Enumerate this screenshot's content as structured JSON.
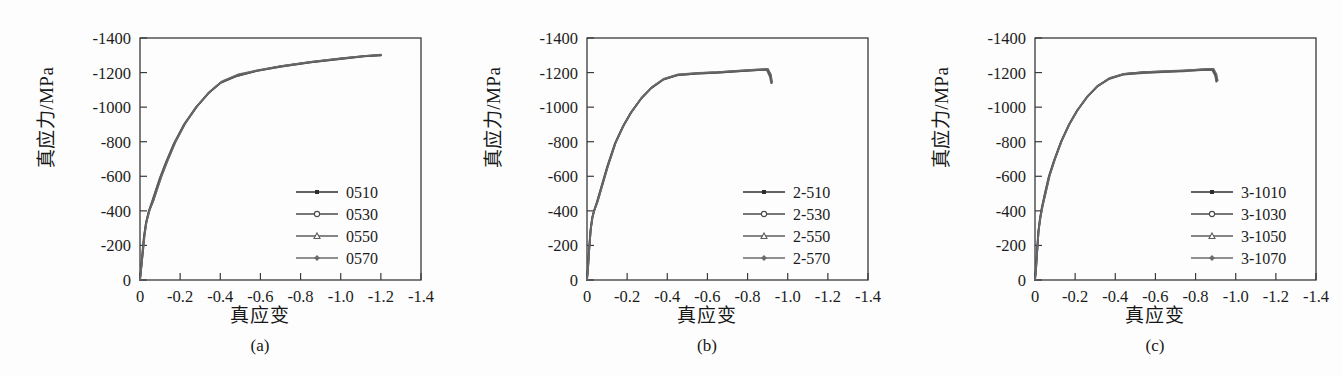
{
  "figure": {
    "background_color": "#fdfdfd",
    "axis_color": "#3a3a3a",
    "text_color": "#1c1c1c"
  },
  "chart_data": [
    {
      "type": "line",
      "panel": "a",
      "caption": "(a)",
      "title": "",
      "xlabel": "真应变",
      "ylabel": "真应力/MPa",
      "xlim": [
        0,
        -1.4
      ],
      "ylim": [
        0,
        -1400
      ],
      "xticks": [
        "0",
        "-0.2",
        "-0.4",
        "-0.6",
        "-0.8",
        "-1.0",
        "-1.2",
        "-1.4"
      ],
      "xtick_values": [
        0,
        -0.2,
        -0.4,
        -0.6,
        -0.8,
        -1.0,
        -1.2,
        -1.4
      ],
      "yticks": [
        "0",
        "-200",
        "-400",
        "-600",
        "-800",
        "-1000",
        "-1200",
        "-1400"
      ],
      "ytick_values": [
        0,
        -200,
        -400,
        -600,
        -800,
        -1000,
        -1200,
        -1400
      ],
      "grid": false,
      "legend_position": "lower-right",
      "series": [
        {
          "name": "0510",
          "color": "#2e2e2e",
          "marker": "filled-square",
          "x": [
            0,
            -0.005,
            -0.012,
            -0.02,
            -0.03,
            -0.045,
            -0.06,
            -0.08,
            -0.1,
            -0.13,
            -0.17,
            -0.22,
            -0.28,
            -0.34,
            -0.4,
            -0.48,
            -0.58,
            -0.7,
            -0.85,
            -1.0,
            -1.12,
            -1.2
          ],
          "y": [
            0,
            -60,
            -150,
            -250,
            -330,
            -400,
            -450,
            -520,
            -590,
            -680,
            -790,
            -900,
            -1000,
            -1080,
            -1140,
            -1180,
            -1210,
            -1235,
            -1260,
            -1280,
            -1295,
            -1300
          ]
        },
        {
          "name": "0530",
          "color": "#4a4a4a",
          "marker": "open-circle",
          "x": [
            0,
            -0.006,
            -0.014,
            -0.022,
            -0.032,
            -0.048,
            -0.065,
            -0.085,
            -0.105,
            -0.135,
            -0.175,
            -0.225,
            -0.285,
            -0.345,
            -0.405,
            -0.485,
            -0.585,
            -0.705,
            -0.855,
            -1.005,
            -1.125,
            -1.2
          ],
          "y": [
            0,
            -65,
            -155,
            -255,
            -335,
            -405,
            -455,
            -525,
            -595,
            -685,
            -795,
            -905,
            -1005,
            -1085,
            -1145,
            -1185,
            -1212,
            -1238,
            -1262,
            -1282,
            -1296,
            -1302
          ]
        },
        {
          "name": "0550",
          "color": "#5c5c5c",
          "marker": "open-triangle",
          "x": [
            0,
            -0.004,
            -0.011,
            -0.019,
            -0.029,
            -0.043,
            -0.058,
            -0.078,
            -0.098,
            -0.128,
            -0.168,
            -0.218,
            -0.278,
            -0.338,
            -0.398,
            -0.478,
            -0.578,
            -0.698,
            -0.848,
            -0.998,
            -1.118,
            -1.2
          ],
          "y": [
            0,
            -58,
            -148,
            -248,
            -328,
            -398,
            -448,
            -518,
            -588,
            -678,
            -788,
            -898,
            -998,
            -1078,
            -1138,
            -1178,
            -1208,
            -1232,
            -1258,
            -1278,
            -1293,
            -1299
          ]
        },
        {
          "name": "0570",
          "color": "#6b6b6b",
          "marker": "filled-diamond",
          "x": [
            0,
            -0.007,
            -0.015,
            -0.024,
            -0.034,
            -0.05,
            -0.068,
            -0.088,
            -0.108,
            -0.138,
            -0.178,
            -0.228,
            -0.288,
            -0.348,
            -0.408,
            -0.488,
            -0.588,
            -0.708,
            -0.858,
            -1.008,
            -1.128,
            -1.2
          ],
          "y": [
            0,
            -70,
            -160,
            -260,
            -340,
            -410,
            -460,
            -530,
            -600,
            -690,
            -800,
            -910,
            -1010,
            -1090,
            -1150,
            -1190,
            -1215,
            -1240,
            -1264,
            -1284,
            -1298,
            -1304
          ]
        }
      ]
    },
    {
      "type": "line",
      "panel": "b",
      "caption": "(b)",
      "title": "",
      "xlabel": "真应变",
      "ylabel": "真应力/MPa",
      "xlim": [
        0,
        -1.4
      ],
      "ylim": [
        0,
        -1400
      ],
      "xticks": [
        "0",
        "-0.2",
        "-0.4",
        "-0.6",
        "-0.8",
        "-1.0",
        "-1.2",
        "-1.4"
      ],
      "xtick_values": [
        0,
        -0.2,
        -0.4,
        -0.6,
        -0.8,
        -1.0,
        -1.2,
        -1.4
      ],
      "yticks": [
        "0",
        "-200",
        "-400",
        "-600",
        "-800",
        "-1000",
        "-1200",
        "-1400"
      ],
      "ytick_values": [
        0,
        -200,
        -400,
        -600,
        -800,
        -1000,
        -1200,
        -1400
      ],
      "grid": false,
      "legend_position": "lower-right",
      "series": [
        {
          "name": "2-510",
          "color": "#2e2e2e",
          "marker": "filled-square",
          "x": [
            0,
            -0.004,
            -0.01,
            -0.018,
            -0.026,
            -0.035,
            -0.05,
            -0.07,
            -0.1,
            -0.14,
            -0.18,
            -0.22,
            -0.27,
            -0.32,
            -0.38,
            -0.45,
            -0.55,
            -0.65,
            -0.75,
            -0.85,
            -0.9,
            -0.915,
            -0.92
          ],
          "y": [
            0,
            -60,
            -170,
            -290,
            -360,
            -400,
            -450,
            -530,
            -650,
            -790,
            -890,
            -970,
            -1050,
            -1110,
            -1160,
            -1185,
            -1195,
            -1200,
            -1208,
            -1215,
            -1218,
            -1180,
            -1140
          ]
        },
        {
          "name": "2-530",
          "color": "#4a4a4a",
          "marker": "open-circle",
          "x": [
            0,
            -0.005,
            -0.011,
            -0.019,
            -0.028,
            -0.037,
            -0.053,
            -0.073,
            -0.103,
            -0.143,
            -0.183,
            -0.223,
            -0.273,
            -0.323,
            -0.383,
            -0.453,
            -0.553,
            -0.653,
            -0.753,
            -0.853,
            -0.9,
            -0.915,
            -0.92
          ],
          "y": [
            0,
            -62,
            -175,
            -295,
            -365,
            -405,
            -455,
            -535,
            -655,
            -795,
            -895,
            -975,
            -1055,
            -1115,
            -1163,
            -1188,
            -1197,
            -1202,
            -1210,
            -1217,
            -1220,
            -1185,
            -1145
          ]
        },
        {
          "name": "2-550",
          "color": "#5c5c5c",
          "marker": "open-triangle",
          "x": [
            0,
            -0.003,
            -0.009,
            -0.017,
            -0.025,
            -0.034,
            -0.048,
            -0.068,
            -0.098,
            -0.138,
            -0.178,
            -0.218,
            -0.268,
            -0.318,
            -0.378,
            -0.448,
            -0.548,
            -0.648,
            -0.748,
            -0.848,
            -0.895,
            -0.91,
            -0.918
          ],
          "y": [
            0,
            -58,
            -168,
            -288,
            -358,
            -398,
            -448,
            -528,
            -648,
            -788,
            -888,
            -968,
            -1048,
            -1108,
            -1158,
            -1183,
            -1193,
            -1198,
            -1206,
            -1213,
            -1216,
            -1178,
            -1138
          ]
        },
        {
          "name": "2-570",
          "color": "#6b6b6b",
          "marker": "filled-diamond",
          "x": [
            0,
            -0.006,
            -0.012,
            -0.02,
            -0.029,
            -0.039,
            -0.055,
            -0.075,
            -0.105,
            -0.145,
            -0.185,
            -0.225,
            -0.275,
            -0.325,
            -0.385,
            -0.455,
            -0.555,
            -0.655,
            -0.755,
            -0.855,
            -0.902,
            -0.917,
            -0.922
          ],
          "y": [
            0,
            -65,
            -178,
            -298,
            -368,
            -408,
            -458,
            -538,
            -658,
            -798,
            -898,
            -978,
            -1058,
            -1118,
            -1166,
            -1190,
            -1199,
            -1204,
            -1212,
            -1219,
            -1222,
            -1188,
            -1148
          ]
        }
      ]
    },
    {
      "type": "line",
      "panel": "c",
      "caption": "(c)",
      "title": "",
      "xlabel": "真应变",
      "ylabel": "真应力/MPa",
      "xlim": [
        0,
        -1.4
      ],
      "ylim": [
        0,
        -1400
      ],
      "xticks": [
        "0",
        "-0.2",
        "-0.4",
        "-0.6",
        "-0.8",
        "-1.0",
        "-1.2",
        "-1.4"
      ],
      "xtick_values": [
        0,
        -0.2,
        -0.4,
        -0.6,
        -0.8,
        -1.0,
        -1.2,
        -1.4
      ],
      "yticks": [
        "0",
        "-200",
        "-400",
        "-600",
        "-800",
        "-1000",
        "-1200",
        "-1400"
      ],
      "ytick_values": [
        0,
        -200,
        -400,
        -600,
        -800,
        -1000,
        -1200,
        -1400
      ],
      "grid": false,
      "legend_position": "lower-right",
      "series": [
        {
          "name": "3-1010",
          "color": "#2e2e2e",
          "marker": "filled-square",
          "x": [
            0,
            -0.004,
            -0.01,
            -0.017,
            -0.025,
            -0.035,
            -0.05,
            -0.07,
            -0.095,
            -0.13,
            -0.17,
            -0.21,
            -0.26,
            -0.31,
            -0.37,
            -0.44,
            -0.54,
            -0.64,
            -0.74,
            -0.83,
            -0.885,
            -0.9,
            -0.905
          ],
          "y": [
            0,
            -55,
            -160,
            -280,
            -355,
            -420,
            -500,
            -600,
            -690,
            -800,
            -900,
            -980,
            -1060,
            -1120,
            -1165,
            -1190,
            -1200,
            -1205,
            -1210,
            -1216,
            -1218,
            -1185,
            -1150
          ]
        },
        {
          "name": "3-1030",
          "color": "#4a4a4a",
          "marker": "open-circle",
          "x": [
            0,
            -0.005,
            -0.011,
            -0.018,
            -0.027,
            -0.037,
            -0.053,
            -0.073,
            -0.098,
            -0.133,
            -0.173,
            -0.213,
            -0.263,
            -0.313,
            -0.373,
            -0.443,
            -0.543,
            -0.643,
            -0.743,
            -0.833,
            -0.888,
            -0.902,
            -0.908
          ],
          "y": [
            0,
            -58,
            -165,
            -285,
            -358,
            -425,
            -505,
            -605,
            -695,
            -805,
            -905,
            -985,
            -1063,
            -1123,
            -1168,
            -1192,
            -1202,
            -1207,
            -1212,
            -1218,
            -1221,
            -1188,
            -1153
          ]
        },
        {
          "name": "3-1050",
          "color": "#5c5c5c",
          "marker": "open-triangle",
          "x": [
            0,
            -0.003,
            -0.009,
            -0.016,
            -0.024,
            -0.033,
            -0.048,
            -0.068,
            -0.093,
            -0.128,
            -0.168,
            -0.208,
            -0.258,
            -0.308,
            -0.368,
            -0.438,
            -0.538,
            -0.638,
            -0.738,
            -0.828,
            -0.882,
            -0.897,
            -0.903
          ],
          "y": [
            0,
            -52,
            -157,
            -277,
            -352,
            -417,
            -497,
            -597,
            -687,
            -797,
            -897,
            -977,
            -1057,
            -1117,
            -1162,
            -1187,
            -1197,
            -1202,
            -1207,
            -1213,
            -1215,
            -1182,
            -1147
          ]
        },
        {
          "name": "3-1070",
          "color": "#6b6b6b",
          "marker": "filled-diamond",
          "x": [
            0,
            -0.006,
            -0.012,
            -0.019,
            -0.028,
            -0.039,
            -0.055,
            -0.075,
            -0.1,
            -0.135,
            -0.175,
            -0.215,
            -0.265,
            -0.315,
            -0.375,
            -0.445,
            -0.545,
            -0.645,
            -0.745,
            -0.835,
            -0.89,
            -0.905,
            -0.911
          ],
          "y": [
            0,
            -60,
            -168,
            -288,
            -362,
            -428,
            -508,
            -608,
            -698,
            -808,
            -908,
            -988,
            -1066,
            -1126,
            -1170,
            -1194,
            -1204,
            -1209,
            -1214,
            -1220,
            -1223,
            -1190,
            -1155
          ]
        }
      ]
    }
  ]
}
